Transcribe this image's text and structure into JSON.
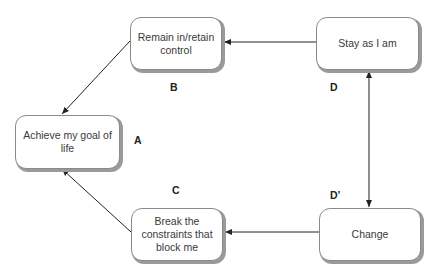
{
  "diagram": {
    "type": "flow",
    "nodes": [
      {
        "id": "A",
        "text": "Achieve my goal of life",
        "x": 15,
        "y": 115,
        "w": 105,
        "h": 54
      },
      {
        "id": "B",
        "text": "Remain in/retain control",
        "x": 130,
        "y": 17,
        "w": 92,
        "h": 53
      },
      {
        "id": "C",
        "text": "Break the constraints that block me",
        "x": 131,
        "y": 208,
        "w": 92,
        "h": 53
      },
      {
        "id": "D",
        "text": "Stay as I am",
        "x": 316,
        "y": 17,
        "w": 103,
        "h": 53
      },
      {
        "id": "D_prime",
        "text": "Change",
        "x": 319,
        "y": 208,
        "w": 102,
        "h": 53
      }
    ],
    "labels": [
      {
        "id": "A",
        "text": "A",
        "x": 134,
        "y": 134
      },
      {
        "id": "B",
        "text": "B",
        "x": 170,
        "y": 81
      },
      {
        "id": "C",
        "text": "C",
        "x": 172,
        "y": 184
      },
      {
        "id": "D",
        "text": "D",
        "x": 330,
        "y": 81
      },
      {
        "id": "D_prime",
        "text": "D’",
        "x": 330,
        "y": 189
      }
    ],
    "edges": [
      {
        "from": "Stay as I am",
        "to": "Remain in/retain control",
        "direction": "one-way"
      },
      {
        "from": "Remain in/retain control",
        "to": "Achieve my goal of life",
        "direction": "one-way"
      },
      {
        "from": "Change",
        "to": "Break the constraints that block me",
        "direction": "one-way"
      },
      {
        "from": "Break the constraints that block me",
        "to": "Achieve my goal of life",
        "direction": "one-way"
      },
      {
        "from": "Stay as I am",
        "to": "Change",
        "direction": "two-way"
      }
    ],
    "colors": {
      "edge": "#222222",
      "node_border": "#8a8a8a",
      "node_shadow": "#9a9a9a",
      "text": "#3a3a3a"
    }
  }
}
